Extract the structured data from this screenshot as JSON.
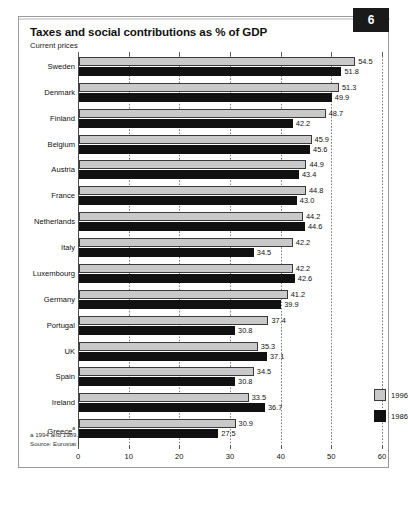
{
  "header": {
    "title": "Taxes and social contributions as % of GDP",
    "subtitle": "Current prices",
    "badge": "6"
  },
  "footer": {
    "footnote_a": "a 1994 and 1989.",
    "source": "Source: Eurostat"
  },
  "legend": {
    "entries": [
      {
        "label": "1996",
        "color": "#c9c9c9"
      },
      {
        "label": "1986",
        "color": "#111111"
      }
    ]
  },
  "chart_data": {
    "type": "bar",
    "orientation": "horizontal",
    "title": "Taxes and social contributions as % of GDP",
    "subtitle": "Current prices",
    "xlabel": "",
    "ylabel": "",
    "xlim": [
      0,
      60
    ],
    "xticks": [
      0,
      10,
      20,
      30,
      40,
      50,
      60
    ],
    "xtick_labels": [
      "0",
      "10",
      "20",
      "30",
      "40",
      "50",
      "60"
    ],
    "grid": true,
    "legend_position": "bottom-right",
    "categories": [
      "Sweden",
      "Denmark",
      "Finland",
      "Belgium",
      "Austria",
      "France",
      "Netherlands",
      "Italy",
      "Luxembourg",
      "Germany",
      "Portugal",
      "UK",
      "Spain",
      "Ireland",
      "Greece"
    ],
    "category_notes": {
      "Greece": "a"
    },
    "series": [
      {
        "name": "1996",
        "color": "#c9c9c9",
        "values": [
          54.5,
          51.3,
          48.7,
          45.9,
          44.9,
          44.8,
          44.2,
          42.2,
          42.2,
          41.2,
          37.4,
          35.3,
          34.5,
          33.5,
          30.9
        ],
        "labels": [
          "54.5",
          "51.3",
          "48.7",
          "45.9",
          "44.9",
          "44.8",
          "44.2",
          "42.2",
          "42.2",
          "41.2",
          "37.4",
          "35.3",
          "34.5",
          "33.5",
          "30.9"
        ]
      },
      {
        "name": "1986",
        "color": "#111111",
        "values": [
          51.8,
          49.9,
          42.2,
          45.6,
          43.4,
          43.0,
          44.6,
          34.5,
          42.6,
          39.9,
          30.8,
          37.1,
          30.8,
          36.7,
          27.5
        ],
        "labels": [
          "51.8",
          "49.9",
          "42.2",
          "45.6",
          "43.4",
          "43.0",
          "44.6",
          "34.5",
          "42.6",
          "39.9",
          "30.8",
          "37.1",
          "30.8",
          "36.7",
          "27.5"
        ]
      }
    ]
  }
}
